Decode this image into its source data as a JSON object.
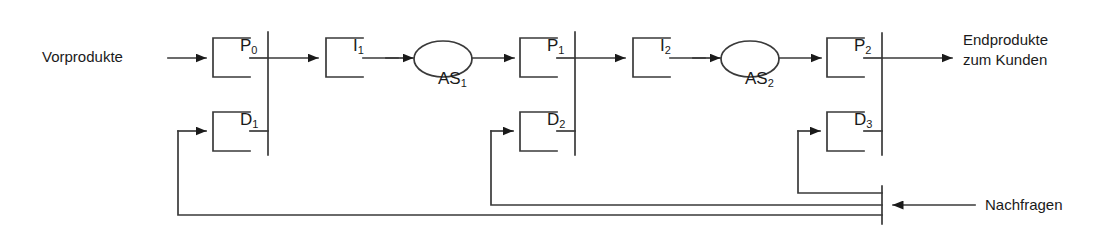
{
  "diagram": {
    "type": "block-flow",
    "colors": {
      "line": "#3a3a3a",
      "text": "#1a1a1a",
      "background": "#ffffff"
    },
    "inputs": [
      {
        "id": "vorprodukte",
        "label": "Vorprodukte"
      }
    ],
    "outputs": [
      {
        "id": "endprodukte",
        "label_line1": "Endprodukte",
        "label_line2": "zum Kunden"
      },
      {
        "id": "nachfragen",
        "label": "Nachfragen"
      }
    ],
    "nodes": [
      {
        "id": "p0",
        "kind": "bracket",
        "base": "P",
        "sub": "0"
      },
      {
        "id": "d1",
        "kind": "bracket",
        "base": "D",
        "sub": "1"
      },
      {
        "id": "i1",
        "kind": "bracket",
        "base": "I",
        "sub": "1"
      },
      {
        "id": "as1",
        "kind": "ellipse",
        "base": "AS",
        "sub": "1"
      },
      {
        "id": "p1",
        "kind": "bracket",
        "base": "P",
        "sub": "1"
      },
      {
        "id": "d2",
        "kind": "bracket",
        "base": "D",
        "sub": "2"
      },
      {
        "id": "i2",
        "kind": "bracket",
        "base": "I",
        "sub": "2"
      },
      {
        "id": "as2",
        "kind": "ellipse",
        "base": "AS",
        "sub": "2"
      },
      {
        "id": "p2",
        "kind": "bracket",
        "base": "P",
        "sub": "2"
      },
      {
        "id": "d3",
        "kind": "bracket",
        "base": "D",
        "sub": "3"
      }
    ],
    "bars": [
      {
        "id": "bar1",
        "x": 268
      },
      {
        "id": "bar2",
        "x": 575
      },
      {
        "id": "bar3",
        "x": 882
      }
    ]
  }
}
